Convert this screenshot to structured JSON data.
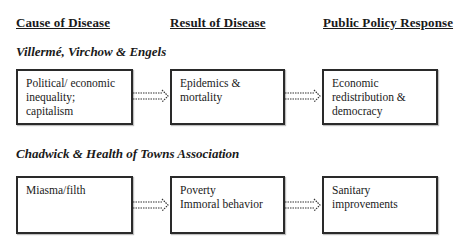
{
  "headers": {
    "cause": "Cause of Disease",
    "result": "Result of Disease",
    "policy": "Public Policy Response"
  },
  "groups": [
    {
      "title": "Villermé, Virchow & Engels",
      "cause": [
        "Political/ economic",
        "inequality;",
        "capitalism"
      ],
      "result": [
        "Epidemics &",
        "mortality"
      ],
      "policy": [
        "Economic",
        "redistribution &",
        "democracy"
      ]
    },
    {
      "title": "Chadwick & Health of Towns Association",
      "cause": [
        "Miasma/filth"
      ],
      "result": [
        "Poverty",
        "Immoral behavior"
      ],
      "policy": [
        "Sanitary",
        "improvements"
      ]
    }
  ],
  "colors": {
    "border": "#2a2a2a",
    "text": "#1a1a1a",
    "background": "#ffffff"
  }
}
